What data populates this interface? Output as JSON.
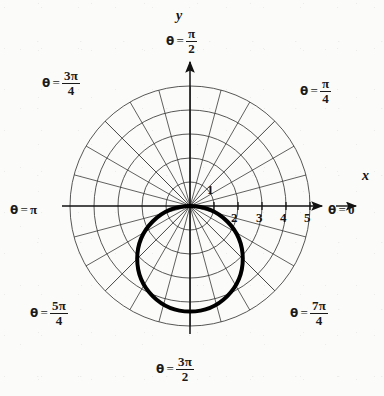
{
  "figure": {
    "kind": "polar-grid-plot",
    "background_color": "#fbfbf9",
    "ink_color": "#1a1a1a",
    "grid_color": "#3a3a3a",
    "curve_color": "#000000"
  },
  "axes": {
    "x_label": "x",
    "y_label": "y",
    "origin_px": [
      190,
      206
    ],
    "unit_px": 24
  },
  "radial_ticks": {
    "labels": [
      "1",
      "2",
      "3",
      "4",
      "5"
    ],
    "values": [
      1,
      2,
      3,
      4,
      5
    ]
  },
  "angle_labels": [
    {
      "id": "theta-0",
      "theta_text": "θ = 0",
      "base": "θ",
      "eq": "=",
      "whole": "0",
      "num": "",
      "den": "",
      "deg": 0
    },
    {
      "id": "theta-pi-4",
      "theta_text": "θ = π/4",
      "base": "θ",
      "eq": "=",
      "whole": "",
      "num": "π",
      "den": "4",
      "deg": 45
    },
    {
      "id": "theta-pi-2",
      "theta_text": "θ = π/2",
      "base": "θ",
      "eq": "=",
      "whole": "",
      "num": "π",
      "den": "2",
      "deg": 90
    },
    {
      "id": "theta-3pi-4",
      "theta_text": "θ = 3π/4",
      "base": "θ",
      "eq": "=",
      "whole": "",
      "num": "3π",
      "den": "4",
      "deg": 135
    },
    {
      "id": "theta-pi",
      "theta_text": "θ = π",
      "base": "θ",
      "eq": "=",
      "whole": "π",
      "num": "",
      "den": "",
      "deg": 180
    },
    {
      "id": "theta-5pi-4",
      "theta_text": "θ = 5π/4",
      "base": "θ",
      "eq": "=",
      "whole": "",
      "num": "5π",
      "den": "4",
      "deg": 225
    },
    {
      "id": "theta-3pi-2",
      "theta_text": "θ = 3π/2",
      "base": "θ",
      "eq": "=",
      "whole": "",
      "num": "3π",
      "den": "2",
      "deg": 270
    },
    {
      "id": "theta-7pi-4",
      "theta_text": "θ = 7π/4",
      "base": "θ",
      "eq": "=",
      "whole": "",
      "num": "7π",
      "den": "4",
      "deg": 315
    }
  ],
  "chart_data": {
    "type": "line",
    "coordinate_system": "polar",
    "title": "",
    "xlabel": "x",
    "ylabel": "y",
    "grid": true,
    "legend": "none",
    "r_range": [
      0,
      5
    ],
    "r_gridlines": [
      1,
      2,
      3,
      4,
      5
    ],
    "theta_gridlines_deg": [
      0,
      15,
      30,
      45,
      60,
      75,
      90,
      105,
      120,
      135,
      150,
      165,
      180,
      195,
      210,
      225,
      240,
      255,
      270,
      285,
      300,
      315,
      330,
      345
    ],
    "tick_labels_r": [
      "1",
      "2",
      "3",
      "4",
      "5"
    ],
    "theta_tick_labels": [
      "θ = 0",
      "θ = π/4",
      "θ = π/2",
      "θ = 3π/4",
      "θ = π",
      "θ = 5π/4",
      "θ = 3π/2",
      "θ = 7π/4"
    ],
    "series": [
      {
        "name": "bold-curve",
        "equation_polar": "r = -2.2 sin(θ)",
        "description": "circle of radius 2.2 tangent to the polar axis at the pole, lying in the lower half plane",
        "center_cartesian": [
          0,
          -2.2
        ],
        "radius": 2.2,
        "line_width_px": 4,
        "color": "#000000",
        "points_cartesian": [
          [
            0,
            0
          ],
          [
            1.1,
            -0.59
          ],
          [
            1.9,
            -1.1
          ],
          [
            2.2,
            -2.2
          ],
          [
            1.9,
            -3.3
          ],
          [
            1.1,
            -3.81
          ],
          [
            0,
            -4.4
          ],
          [
            -1.1,
            -3.81
          ],
          [
            -1.9,
            -3.3
          ],
          [
            -2.2,
            -2.2
          ],
          [
            -1.9,
            -1.1
          ],
          [
            -1.1,
            -0.59
          ],
          [
            0,
            0
          ]
        ]
      }
    ]
  }
}
